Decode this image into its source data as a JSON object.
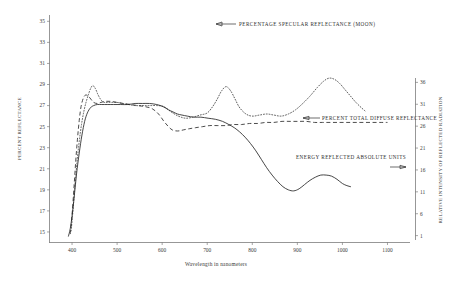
{
  "chart_data": {
    "type": "line",
    "title": "",
    "xlabel": "Wavelength in nanometers",
    "ylabel": "PERCENT REFLECTANCE",
    "y2label": "RELATIVE INTENSITY OF REFLECTED RADIATION",
    "xlim": [
      350,
      1150
    ],
    "ylim": [
      14,
      35.6
    ],
    "y2lim": [
      0,
      37
    ],
    "grid": false,
    "legend_position": "inline-annotations",
    "xticks": [
      400,
      500,
      600,
      700,
      800,
      900,
      1000,
      1100
    ],
    "yticks": [
      15,
      17,
      19,
      21,
      23,
      25,
      27,
      29,
      31,
      33,
      35
    ],
    "y2ticks": [
      1,
      6,
      11,
      16,
      21,
      26,
      31,
      36
    ],
    "annotations": [
      {
        "name": "percentage-specular-reflectance",
        "text": "PERCENTAGE SPECULAR REFLECTANCE (MOON)",
        "arrow": "left",
        "x": 700,
        "y": 34.6
      },
      {
        "name": "percent-total-diffuse-reflectance",
        "text": "PERCENT TOTAL DIFFUSE REFLECTANCE",
        "arrow": "left",
        "x": 905,
        "y": 25.0
      },
      {
        "name": "energy-reflected-absolute-units",
        "text": "ENERGY REFLECTED ABSOLUTE UNITS",
        "arrow": "right",
        "x": 835,
        "y": 21.2
      }
    ],
    "series": [
      {
        "name": "PERCENTAGE SPECULAR REFLECTANCE (MOON)",
        "style": "dotted",
        "x": [
          398,
          402,
          406,
          411,
          416,
          421,
          426,
          431,
          436,
          441,
          446,
          452,
          458,
          465,
          472,
          480,
          490,
          500,
          512,
          525,
          540,
          556,
          572,
          588,
          604,
          620,
          636,
          652,
          668,
          684,
          700,
          712,
          722,
          732,
          742,
          752,
          762,
          772,
          786,
          800,
          816,
          832,
          848,
          864,
          880,
          896,
          912,
          928,
          944,
          958,
          970,
          982,
          994,
          1006,
          1018,
          1030,
          1042,
          1050
        ],
        "y": [
          15.1,
          17.0,
          19.2,
          21.6,
          23.6,
          25.2,
          26.4,
          27.3,
          28.0,
          28.6,
          28.9,
          28.6,
          28.0,
          27.5,
          27.3,
          27.3,
          27.3,
          27.3,
          27.2,
          27.1,
          27.0,
          27.0,
          27.0,
          27.0,
          26.9,
          26.4,
          26.0,
          25.8,
          25.9,
          26.1,
          26.3,
          26.9,
          27.6,
          28.4,
          28.8,
          28.4,
          27.6,
          26.8,
          26.2,
          26.0,
          26.1,
          26.2,
          26.1,
          26.0,
          26.2,
          26.6,
          27.2,
          27.9,
          28.7,
          29.3,
          29.6,
          29.5,
          29.1,
          28.5,
          27.9,
          27.3,
          26.8,
          26.5
        ]
      },
      {
        "name": "PERCENT TOTAL DIFFUSE REFLECTANCE",
        "style": "dashed",
        "x": [
          396,
          400,
          404,
          408,
          412,
          416,
          420,
          425,
          430,
          436,
          442,
          448,
          456,
          464,
          474,
          486,
          500,
          514,
          530,
          546,
          562,
          578,
          592,
          604,
          614,
          622,
          630,
          638,
          648,
          660,
          674,
          690,
          706,
          722,
          740,
          758,
          776,
          794,
          812,
          830,
          848,
          866,
          884,
          902,
          920,
          938,
          956,
          974,
          992,
          1010,
          1028,
          1046,
          1064,
          1082,
          1100
        ],
        "y": [
          14.8,
          16.6,
          19.0,
          21.6,
          23.8,
          25.6,
          26.9,
          27.7,
          28.0,
          27.9,
          27.6,
          27.3,
          27.2,
          27.3,
          27.4,
          27.4,
          27.3,
          27.2,
          27.1,
          27.0,
          26.9,
          26.7,
          26.2,
          25.5,
          25.0,
          24.7,
          24.6,
          24.6,
          24.7,
          24.8,
          24.9,
          25.0,
          25.1,
          25.1,
          25.1,
          25.2,
          25.2,
          25.3,
          25.3,
          25.4,
          25.4,
          25.5,
          25.5,
          25.5,
          25.5,
          25.4,
          25.4,
          25.4,
          25.4,
          25.4,
          25.4,
          25.4,
          25.4,
          25.4,
          25.4
        ]
      },
      {
        "name": "ENERGY REFLECTED ABSOLUTE UNITS",
        "style": "solid",
        "x": [
          392,
          396,
          400,
          405,
          410,
          416,
          422,
          428,
          434,
          441,
          448,
          456,
          466,
          478,
          492,
          508,
          524,
          540,
          556,
          572,
          588,
          602,
          614,
          624,
          634,
          644,
          656,
          670,
          686,
          702,
          718,
          734,
          748,
          760,
          772,
          784,
          796,
          808,
          820,
          832,
          844,
          856,
          868,
          880,
          892,
          904,
          916,
          928,
          940,
          952,
          964,
          976,
          988,
          1000,
          1010,
          1018
        ],
        "y": [
          14.6,
          15.3,
          16.5,
          18.4,
          20.5,
          22.5,
          24.2,
          25.5,
          26.3,
          26.8,
          27.0,
          27.1,
          27.1,
          27.1,
          27.1,
          27.1,
          27.1,
          27.2,
          27.2,
          27.2,
          27.1,
          26.9,
          26.6,
          26.4,
          26.2,
          26.1,
          26.0,
          25.9,
          25.9,
          25.8,
          25.7,
          25.5,
          25.2,
          24.9,
          24.5,
          24.0,
          23.4,
          22.7,
          21.9,
          21.1,
          20.4,
          19.8,
          19.3,
          19.0,
          18.9,
          19.1,
          19.5,
          19.9,
          20.2,
          20.4,
          20.4,
          20.3,
          20.0,
          19.6,
          19.4,
          19.3
        ]
      }
    ]
  }
}
